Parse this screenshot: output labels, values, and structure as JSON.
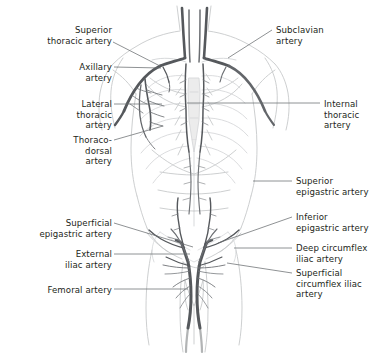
{
  "figure": {
    "background_color": "#ffffff",
    "artery_color": "#55585c",
    "body_outline_color": "#c9cbcd",
    "skeleton_color": "#d7d9db",
    "label_text_color": "#231f20",
    "leader_line_color": "#6a6d70"
  },
  "labels": [
    {
      "id": "superior-thoracic-artery",
      "text": "Superior\nthoracic artery",
      "align": "right",
      "x": 18,
      "y": 25,
      "width": 94,
      "leader": [
        [
          113,
          42
        ],
        [
          160,
          66
        ]
      ]
    },
    {
      "id": "subclavian-artery",
      "text": "Subclavian\nartery",
      "align": "left",
      "x": 276,
      "y": 25,
      "width": 100,
      "leader": [
        [
          272,
          30
        ],
        [
          228,
          58
        ]
      ]
    },
    {
      "id": "axillary-artery",
      "text": "Axillary\nartery",
      "align": "right",
      "x": 26,
      "y": 62,
      "width": 86,
      "leader": [
        [
          114,
          67
        ],
        [
          161,
          68
        ]
      ]
    },
    {
      "id": "lateral-thoracic-artery",
      "text": "Lateral\nthoracic\nartery",
      "align": "right",
      "x": 26,
      "y": 99,
      "width": 86,
      "leader": [
        [
          114,
          104
        ],
        [
          162,
          104
        ]
      ]
    },
    {
      "id": "internal-thoracic-artery",
      "text": "Internal\nthoracic\nartery",
      "align": "left",
      "x": 324,
      "y": 99,
      "width": 64,
      "leader": [
        [
          320,
          103
        ],
        [
          187,
          103
        ]
      ]
    },
    {
      "id": "thoracodorsal-artery",
      "text": "Thoraco-\ndorsal\nartery",
      "align": "right",
      "x": 26,
      "y": 135,
      "width": 86,
      "leader": [
        [
          114,
          140
        ],
        [
          163,
          126
        ]
      ]
    },
    {
      "id": "superior-epigastric-artery",
      "text": "Superior\nepigastric artery",
      "align": "left",
      "x": 296,
      "y": 176,
      "width": 92,
      "leader": [
        [
          292,
          181
        ],
        [
          253,
          181
        ]
      ]
    },
    {
      "id": "inferior-epigastric-artery",
      "text": "Inferior\nepigastric artery",
      "align": "left",
      "x": 296,
      "y": 212,
      "width": 92,
      "leader": [
        [
          292,
          217
        ],
        [
          218,
          243
        ]
      ]
    },
    {
      "id": "superficial-epigastric-artery",
      "text": "Superficial\nepigastric artery",
      "align": "right",
      "x": 12,
      "y": 218,
      "width": 100,
      "leader": [
        [
          114,
          223
        ],
        [
          193,
          247
        ]
      ]
    },
    {
      "id": "deep-circumflex-iliac-artery",
      "text": "Deep circumflex\niliac artery",
      "align": "left",
      "x": 296,
      "y": 243,
      "width": 92,
      "leader": [
        [
          292,
          248
        ],
        [
          234,
          248
        ]
      ]
    },
    {
      "id": "external-iliac-artery",
      "text": "External\niliac artery",
      "align": "right",
      "x": 26,
      "y": 249,
      "width": 86,
      "leader": [
        [
          114,
          254
        ],
        [
          190,
          254
        ]
      ]
    },
    {
      "id": "superficial-circumflex-iliac-artery",
      "text": "Superficial\ncircumflex iliac\nartery",
      "align": "left",
      "x": 296,
      "y": 268,
      "width": 92,
      "leader": [
        [
          292,
          273
        ],
        [
          227,
          263
        ]
      ]
    },
    {
      "id": "femoral-artery",
      "text": "Femoral artery",
      "align": "right",
      "x": 16,
      "y": 285,
      "width": 96,
      "leader": [
        [
          114,
          289
        ],
        [
          188,
          289
        ]
      ]
    }
  ]
}
